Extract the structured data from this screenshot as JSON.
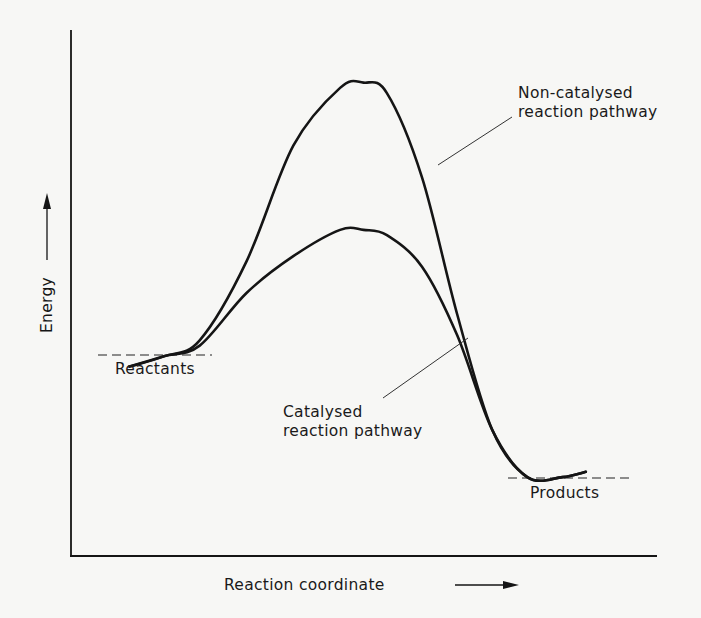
{
  "figure": {
    "title": "",
    "y_axis_label": "Energy",
    "x_axis_label": "Reaction coordinate",
    "y_axis_arrow": "up-arrow",
    "x_axis_arrow": "right-arrow"
  },
  "labels": {
    "reactants": "Reactants",
    "products": "Products",
    "non_catalysed_line1": "Non-catalysed",
    "non_catalysed_line2": "reaction pathway",
    "catalysed_line1": "Catalysed",
    "catalysed_line2": "reaction pathway"
  },
  "colors": {
    "ink": "#151515",
    "background": "#f7f7f5"
  },
  "chart_data": {
    "type": "line",
    "title": "",
    "xlabel": "Reaction coordinate",
    "ylabel": "Energy",
    "axis_ticks": "none",
    "xlim": [
      0,
      100
    ],
    "ylim": [
      0,
      100
    ],
    "grid": false,
    "legend": "none (direct annotations)",
    "levels": [
      {
        "name": "Reactants",
        "energy": 38,
        "x_range": [
          5,
          25
        ],
        "style": "dashed"
      },
      {
        "name": "Products",
        "energy": 15,
        "x_range": [
          74,
          95
        ],
        "style": "dashed"
      }
    ],
    "series": [
      {
        "name": "Non-catalysed reaction pathway",
        "x": [
          10,
          16,
          22,
          30,
          38,
          46,
          50,
          54,
          60,
          66,
          72,
          78,
          84,
          88
        ],
        "y": [
          36,
          38,
          41,
          56,
          78,
          89,
          90,
          88,
          72,
          46,
          24,
          15,
          15,
          16
        ]
      },
      {
        "name": "Catalysed reaction pathway",
        "x": [
          10,
          16,
          22,
          30,
          38,
          46,
          50,
          54,
          60,
          66,
          72,
          78,
          84,
          88
        ],
        "y": [
          36,
          38,
          40,
          50,
          57,
          62,
          62,
          61,
          55,
          42,
          24,
          15,
          15,
          16
        ]
      }
    ],
    "annotations": [
      {
        "text": "Non-catalysed reaction pathway",
        "points_to": "Non-catalysed reaction pathway",
        "position": "top-right"
      },
      {
        "text": "Catalysed reaction pathway",
        "points_to": "Catalysed reaction pathway",
        "position": "lower-middle"
      },
      {
        "text": "Reactants",
        "points_to": "Reactants level",
        "position": "left"
      },
      {
        "text": "Products",
        "points_to": "Products level",
        "position": "right"
      }
    ]
  }
}
